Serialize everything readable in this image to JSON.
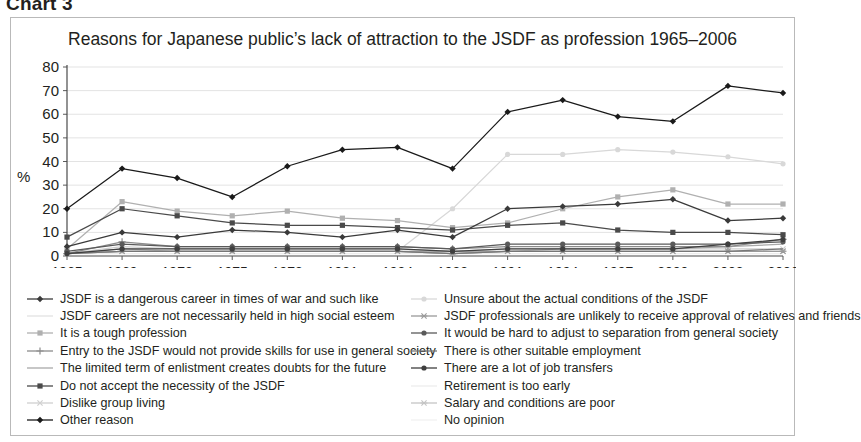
{
  "chart_caption": "Chart 3",
  "figure": {
    "title": "Reasons for Japanese public’s lack of attraction to the JSDF as profession 1965–2006",
    "ylabel": "%"
  },
  "chart_data": {
    "type": "line",
    "title": "Reasons for Japanese public’s lack of attraction to the JSDF as profession 1965–2006",
    "xlabel": "",
    "ylabel": "%",
    "ylim": [
      0,
      80
    ],
    "yticks": [
      0,
      10,
      20,
      30,
      40,
      50,
      60,
      70,
      80
    ],
    "grid": true,
    "legend_position": "bottom",
    "categories": [
      "1965",
      "1969",
      "1972",
      "1975",
      "1978",
      "1981",
      "1984",
      "1988",
      "1991",
      "1994",
      "1997",
      "2000",
      "2003",
      "2006"
    ],
    "series": [
      {
        "name": "JSDF is a dangerous career in times of war and such like",
        "marker": "diamond",
        "color": "#3a3a3a",
        "values": [
          4,
          10,
          8,
          11,
          10,
          8,
          11,
          8,
          20,
          21,
          22,
          24,
          15,
          16
        ]
      },
      {
        "name": "JSDF careers are not necessarily held in high social esteem",
        "marker": "none",
        "color": "#e2e2e2",
        "values": [
          1,
          2,
          2,
          2,
          2,
          2,
          2,
          1,
          2,
          2,
          2,
          2,
          2,
          2
        ]
      },
      {
        "name": "It is a tough profession",
        "marker": "square",
        "color": "#b0b0b0",
        "values": [
          3,
          23,
          19,
          17,
          19,
          16,
          15,
          12,
          14,
          20,
          25,
          28,
          22,
          22
        ]
      },
      {
        "name": "Entry to the JSDF would not provide skills for use in general society",
        "marker": "plus",
        "color": "#8c8c8c",
        "values": [
          1,
          6,
          4,
          4,
          4,
          4,
          4,
          3,
          4,
          4,
          4,
          4,
          4,
          7
        ]
      },
      {
        "name": "The limited term of enlistment creates doubts for the future",
        "marker": "none",
        "color": "#a9a9a9",
        "values": [
          1,
          3,
          2,
          2,
          2,
          2,
          2,
          2,
          2,
          3,
          3,
          3,
          4,
          5
        ]
      },
      {
        "name": "Do not accept the necessity of the JSDF",
        "marker": "square",
        "color": "#4a4a4a",
        "values": [
          8,
          20,
          17,
          14,
          13,
          13,
          12,
          11,
          13,
          14,
          11,
          10,
          10,
          9
        ]
      },
      {
        "name": "Dislike group living",
        "marker": "x",
        "color": "#cfcfcf",
        "values": [
          1,
          4,
          3,
          3,
          3,
          3,
          3,
          2,
          3,
          3,
          3,
          3,
          3,
          3
        ]
      },
      {
        "name": "Other reason",
        "marker": "diamond",
        "color": "#1a1a1a",
        "values": [
          20,
          37,
          33,
          25,
          38,
          45,
          46,
          37,
          61,
          66,
          59,
          57,
          72,
          69
        ]
      },
      {
        "name": "Unsure about the actual conditions of the JSDF",
        "marker": "circle",
        "color": "#d8d8d8",
        "values": [
          1,
          2,
          2,
          2,
          2,
          2,
          2,
          20,
          43,
          43,
          45,
          44,
          42,
          39
        ]
      },
      {
        "name": "JSDF professionals are unlikely to receive approval of relatives and friends",
        "marker": "asterisk",
        "color": "#9a9a9a",
        "values": [
          1,
          2,
          2,
          2,
          2,
          2,
          2,
          1,
          2,
          2,
          2,
          2,
          2,
          2
        ]
      },
      {
        "name": "It would be hard to adjust to separation from general society",
        "marker": "circle",
        "color": "#5a5a5a",
        "values": [
          2,
          5,
          4,
          4,
          4,
          4,
          4,
          3,
          5,
          5,
          5,
          5,
          5,
          6
        ]
      },
      {
        "name": "There is other suitable employment",
        "marker": "none",
        "color": "#777777",
        "values": [
          1,
          2,
          2,
          2,
          2,
          2,
          2,
          1,
          2,
          2,
          2,
          2,
          2,
          3
        ]
      },
      {
        "name": "There are a lot of job transfers",
        "marker": "circle",
        "color": "#3f3f3f",
        "values": [
          1,
          3,
          3,
          3,
          3,
          3,
          3,
          2,
          3,
          3,
          3,
          3,
          5,
          7
        ]
      },
      {
        "name": "Retirement is too early",
        "marker": "none",
        "color": "#ededed",
        "values": [
          1,
          1,
          1,
          1,
          1,
          1,
          1,
          1,
          1,
          1,
          1,
          1,
          1,
          1
        ]
      },
      {
        "name": "Salary and conditions are poor",
        "marker": "asterisk",
        "color": "#c4c4c4",
        "values": [
          1,
          2,
          2,
          2,
          2,
          2,
          2,
          1,
          2,
          2,
          2,
          2,
          2,
          2
        ]
      },
      {
        "name": "No opinion",
        "marker": "none",
        "color": "#f2f2f2",
        "values": [
          1,
          1,
          1,
          1,
          1,
          1,
          1,
          1,
          1,
          1,
          1,
          1,
          1,
          1
        ]
      }
    ]
  }
}
